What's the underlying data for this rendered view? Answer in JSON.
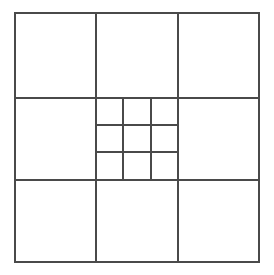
{
  "figure": {
    "canvas": {
      "width": 274,
      "height": 275,
      "background": "#ffffff"
    },
    "stroke_color": "#4a4a4a",
    "stroke_width": 2,
    "outer_square": {
      "x": 15,
      "y": 13,
      "width": 244,
      "height": 249
    },
    "outer_grid": {
      "rows": 3,
      "cols": 3,
      "vertical_dividers": [
        96,
        178
      ],
      "horizontal_dividers": [
        98,
        180
      ]
    },
    "inner_square": {
      "x": 96,
      "y": 98,
      "width": 82,
      "height": 82
    },
    "inner_grid": {
      "rows": 3,
      "cols": 3,
      "vertical_dividers": [
        123,
        151
      ],
      "horizontal_dividers": [
        125,
        152
      ]
    },
    "cell_labels": [],
    "annotations": []
  },
  "chart_data": {
    "type": "diagram",
    "total_cells_outer": 9,
    "total_cells_inner": 9,
    "labels": [],
    "values": []
  }
}
